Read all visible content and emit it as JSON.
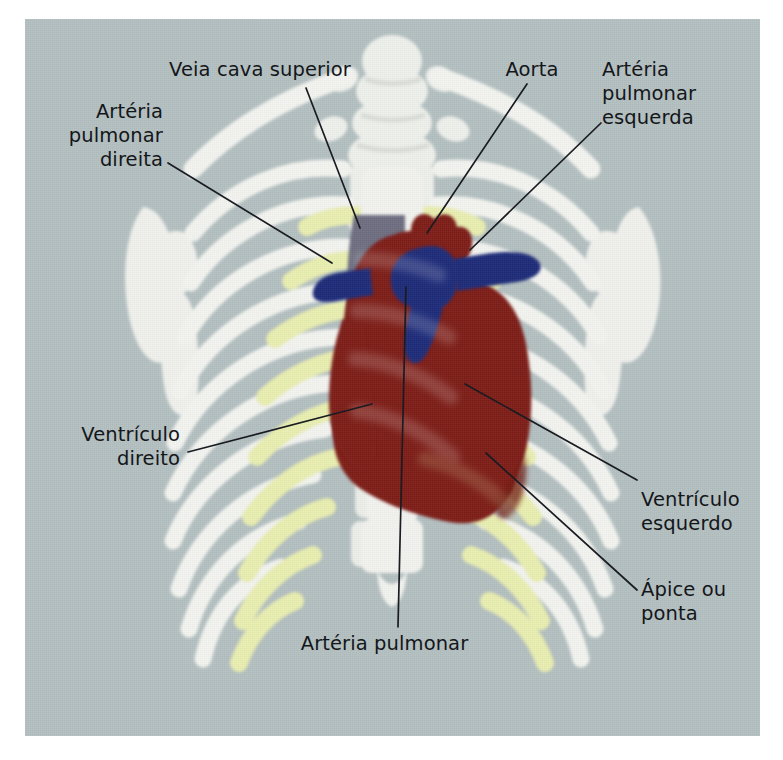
{
  "figure": {
    "language": "pt-BR",
    "panel_background": "#b3bfc0",
    "page_background": "#ffffff"
  },
  "palette": {
    "background_gray": "#b3bfc0",
    "bone_white": "#f3f4f0",
    "cartilage_yellow": "#e9eeb0",
    "heart_red": "#7d1c14",
    "vein_navy": "#1d2a78",
    "vena_cava_gray": "#6d6d80",
    "leader_line": "#1a1c22",
    "text": "#14161a"
  },
  "labels": [
    {
      "id": "veia-cava-superior",
      "text": "Veia cava superior",
      "align": "center",
      "x": 155,
      "y": 58,
      "width": 210,
      "leader": {
        "x1": 306,
        "y1": 88,
        "x2": 360,
        "y2": 228
      }
    },
    {
      "id": "arteria-pulmonar-direita",
      "text": "Artéria\npulmonar\ndireita",
      "align": "right",
      "x": 38,
      "y": 100,
      "width": 125,
      "leader": {
        "x1": 168,
        "y1": 163,
        "x2": 332,
        "y2": 263
      }
    },
    {
      "id": "aorta",
      "text": "Aorta",
      "align": "center",
      "x": 492,
      "y": 58,
      "width": 80,
      "leader": {
        "x1": 527,
        "y1": 84,
        "x2": 427,
        "y2": 233
      }
    },
    {
      "id": "arteria-pulmonar-esquerda",
      "text": "Artéria\npulmonar\nesquerda",
      "align": "left",
      "x": 602,
      "y": 58,
      "width": 140,
      "leader": {
        "x1": 601,
        "y1": 123,
        "x2": 470,
        "y2": 250
      }
    },
    {
      "id": "ventriculo-direito",
      "text": "Ventrículo\ndireito",
      "align": "right",
      "x": 40,
      "y": 423,
      "width": 140,
      "leader": {
        "x1": 188,
        "y1": 452,
        "x2": 372,
        "y2": 404
      }
    },
    {
      "id": "ventriculo-esquerdo",
      "text": "Ventrículo\nesquerdo",
      "align": "left",
      "x": 641,
      "y": 488,
      "width": 135,
      "leader": {
        "x1": 637,
        "y1": 480,
        "x2": 465,
        "y2": 384
      }
    },
    {
      "id": "apice-ou-ponta",
      "text": "Ápice ou\nponta",
      "align": "left",
      "x": 641,
      "y": 578,
      "width": 120,
      "leader": {
        "x1": 637,
        "y1": 590,
        "x2": 486,
        "y2": 453
      }
    },
    {
      "id": "arteria-pulmonar",
      "text": "Artéria pulmonar",
      "align": "center",
      "x": 262,
      "y": 632,
      "width": 245,
      "leader": {
        "x1": 398,
        "y1": 627,
        "x2": 406,
        "y2": 287
      }
    }
  ],
  "anatomy": {
    "structures": [
      {
        "id": "heart",
        "name": "Coração",
        "color": "#7d1c14"
      },
      {
        "id": "superior-vena-cava",
        "name": "Veia cava superior",
        "color": "#6d6d80"
      },
      {
        "id": "pulmonary-artery-trunk",
        "name": "Artéria pulmonar",
        "color": "#1d2a78"
      },
      {
        "id": "right-pulmonary-artery",
        "name": "Artéria pulmonar direita",
        "color": "#1d2a78"
      },
      {
        "id": "left-pulmonary-artery",
        "name": "Artéria pulmonar esquerda",
        "color": "#1d2a78"
      },
      {
        "id": "aorta",
        "name": "Aorta",
        "color": "#7d1c14"
      },
      {
        "id": "ribs",
        "name": "Costelas",
        "color": "#f3f4f0"
      },
      {
        "id": "costal-cartilage",
        "name": "Cartilagem costal",
        "color": "#e9eeb0"
      },
      {
        "id": "sternum",
        "name": "Esterno",
        "color": "#f3f4f0"
      },
      {
        "id": "clavicles",
        "name": "Clavículas",
        "color": "#f3f4f0"
      },
      {
        "id": "scapulae",
        "name": "Escápulas",
        "color": "#f3f4f0"
      },
      {
        "id": "humerus",
        "name": "Úmero",
        "color": "#f3f4f0"
      },
      {
        "id": "spine",
        "name": "Coluna vertebral",
        "color": "#f3f4f0"
      }
    ]
  }
}
